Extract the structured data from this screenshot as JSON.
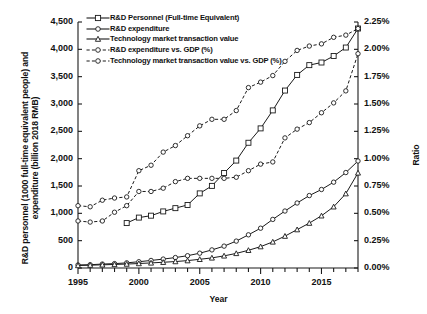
{
  "chart_data": {
    "type": "line",
    "title": "",
    "xlabel": "Year",
    "ylabel": "R&D personnel (1000 full-time equivalent people) and expenditure (billion 2018 RMB)",
    "ylabel_secondary": "Ratio",
    "x": [
      1995,
      1996,
      1997,
      1998,
      1999,
      2000,
      2001,
      2002,
      2003,
      2004,
      2005,
      2006,
      2007,
      2008,
      2009,
      2010,
      2011,
      2012,
      2013,
      2014,
      2015,
      2016,
      2017,
      2018
    ],
    "xlim": [
      1995,
      2018
    ],
    "xticks": [
      1995,
      2000,
      2005,
      2010,
      2015
    ],
    "xticklabels": [
      "1995",
      "2000",
      "2005",
      "2010",
      "2015"
    ],
    "ylim": [
      0,
      4500
    ],
    "yticks": [
      0,
      500,
      1000,
      1500,
      2000,
      2500,
      3000,
      3500,
      4000,
      4500
    ],
    "yticklabels": [
      "0",
      "500",
      "1,000",
      "1,500",
      "2,000",
      "2,500",
      "3,000",
      "3,500",
      "4,000",
      "4,500"
    ],
    "ylim_secondary": [
      0,
      2.25
    ],
    "yticks_secondary": [
      0,
      0.25,
      0.5,
      0.75,
      1.0,
      1.25,
      1.5,
      1.75,
      2.0,
      2.25
    ],
    "yticklabels_secondary": [
      "0.00%",
      "0.25%",
      "0.50%",
      "0.75%",
      "1.00%",
      "1.25%",
      "1.50%",
      "1.75%",
      "2.00%",
      "2.25%"
    ],
    "grid": false,
    "legend_position": "top-left",
    "series": [
      {
        "name": "R&D Personnel (Full-time Equivalent)",
        "axis": "left",
        "marker": "square",
        "linestyle": "solid",
        "x": [
          1999,
          2000,
          2001,
          2002,
          2003,
          2004,
          2005,
          2006,
          2007,
          2008,
          2009,
          2010,
          2011,
          2012,
          2013,
          2014,
          2015,
          2016,
          2017,
          2018
        ],
        "values": [
          822,
          922,
          957,
          1035,
          1095,
          1153,
          1365,
          1502,
          1737,
          1965,
          2291,
          2554,
          2883,
          3246,
          3532,
          3711,
          3759,
          3878,
          4033,
          4381
        ]
      },
      {
        "name": "R&D expenditure",
        "axis": "left",
        "marker": "circle",
        "linestyle": "solid",
        "x": [
          1995,
          1996,
          1997,
          1998,
          1999,
          2000,
          2001,
          2002,
          2003,
          2004,
          2005,
          2006,
          2007,
          2008,
          2009,
          2010,
          2011,
          2012,
          2013,
          2014,
          2015,
          2016,
          2017,
          2018
        ],
        "values": [
          55,
          60,
          72,
          80,
          94,
          115,
          138,
          163,
          191,
          225,
          271,
          331,
          400,
          492,
          607,
          728,
          889,
          1042,
          1189,
          1325,
          1436,
          1570,
          1746,
          1957
        ]
      },
      {
        "name": "Technology market transaction value",
        "axis": "left",
        "marker": "triangle",
        "linestyle": "solid",
        "x": [
          1995,
          1996,
          1997,
          1998,
          1999,
          2000,
          2001,
          2002,
          2003,
          2004,
          2005,
          2006,
          2007,
          2008,
          2009,
          2010,
          2011,
          2012,
          2013,
          2014,
          2015,
          2016,
          2017,
          2018
        ],
        "values": [
          46,
          52,
          58,
          65,
          72,
          82,
          93,
          105,
          118,
          135,
          159,
          185,
          222,
          267,
          324,
          391,
          477,
          583,
          702,
          821,
          955,
          1120,
          1360,
          1740
        ]
      },
      {
        "name": "R&D expenditure vs. GDP (%)",
        "axis": "right",
        "marker": "circle",
        "linestyle": "dashed",
        "x": [
          1995,
          1996,
          1997,
          1998,
          1999,
          2000,
          2001,
          2002,
          2003,
          2004,
          2005,
          2006,
          2007,
          2008,
          2009,
          2010,
          2011,
          2012,
          2013,
          2014,
          2015,
          2016,
          2017,
          2018
        ],
        "values": [
          0.57,
          0.56,
          0.62,
          0.64,
          0.65,
          0.89,
          0.94,
          1.06,
          1.12,
          1.21,
          1.3,
          1.36,
          1.36,
          1.44,
          1.65,
          1.7,
          1.76,
          1.89,
          1.99,
          2.03,
          2.05,
          2.11,
          2.13,
          2.19
        ]
      },
      {
        "name": "Technology market transaction value vs. GDP (%)",
        "axis": "right",
        "marker": "circle",
        "linestyle": "dashed",
        "x": [
          1995,
          1996,
          1997,
          1998,
          1999,
          2000,
          2001,
          2002,
          2003,
          2004,
          2005,
          2006,
          2007,
          2008,
          2009,
          2010,
          2011,
          2012,
          2013,
          2014,
          2015,
          2016,
          2017,
          2018
        ],
        "values": [
          0.43,
          0.42,
          0.43,
          0.51,
          0.57,
          0.7,
          0.7,
          0.73,
          0.79,
          0.82,
          0.82,
          0.82,
          0.82,
          0.83,
          0.89,
          0.95,
          0.97,
          1.19,
          1.27,
          1.33,
          1.42,
          1.51,
          1.62,
          1.96
        ]
      }
    ]
  },
  "legend": {
    "items": [
      {
        "label": "R&D Personnel (Full-time Equivalent)"
      },
      {
        "label": "R&D expenditure"
      },
      {
        "label": "Technology market transaction value"
      },
      {
        "label": "R&D expenditure vs. GDP (%)"
      },
      {
        "label": "Technology market transaction value vs. GDP (%)"
      }
    ]
  },
  "style": {
    "axis_color": "#1a1a1a",
    "line_color": "#1a1a1a",
    "marker_fill": "#ffffff",
    "background": "#ffffff"
  }
}
